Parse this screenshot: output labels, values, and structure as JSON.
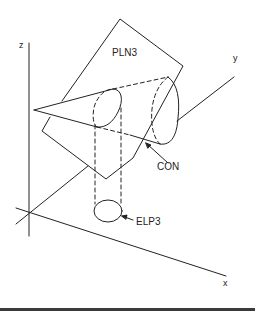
{
  "diagram": {
    "labels": {
      "z_axis": "z",
      "y_axis": "y",
      "x_axis": "x",
      "plane": "PLN3",
      "cone": "CON",
      "ellipse": "ELP3"
    },
    "colors": {
      "stroke": "#222222",
      "background": "#ffffff"
    }
  }
}
